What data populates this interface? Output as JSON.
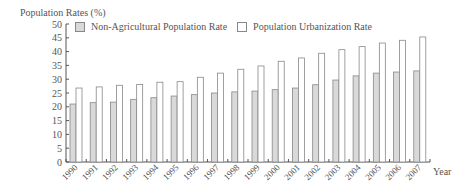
{
  "chart_data": {
    "type": "bar",
    "title": "",
    "ylabel": "Population Rates (%)",
    "xlabel": "Year",
    "ylim": [
      0,
      50
    ],
    "yticks": [
      0,
      5,
      10,
      15,
      20,
      25,
      30,
      35,
      40,
      45,
      50
    ],
    "grid": false,
    "legend_position": "top",
    "categories": [
      "1990",
      "1991",
      "1992",
      "1993",
      "1994",
      "1995",
      "1996",
      "1997",
      "1998",
      "1999",
      "2000",
      "2001",
      "2002",
      "2003",
      "2004",
      "2005",
      "2006",
      "2007"
    ],
    "series": [
      {
        "name": "Non-Agricultural Population Rate",
        "color": "#d9d9d9",
        "values": [
          21.0,
          21.5,
          21.7,
          22.7,
          23.3,
          23.9,
          24.4,
          25.0,
          25.4,
          25.7,
          26.2,
          26.8,
          28.0,
          29.7,
          31.2,
          32.2,
          32.6,
          33.0
        ]
      },
      {
        "name": "Population Urbanization Rate",
        "color": "#ffffff",
        "values": [
          26.8,
          27.2,
          27.8,
          28.1,
          28.9,
          29.1,
          30.7,
          32.2,
          33.6,
          34.8,
          36.5,
          37.7,
          39.4,
          40.7,
          41.8,
          43.1,
          44.1,
          45.3
        ]
      }
    ]
  },
  "labels": {
    "ytitle": "Population Rates (%)",
    "xtitle": "Year",
    "legend_series_1": "Non-Agricultural Population Rate",
    "legend_series_2": "Population Urbanization Rate"
  }
}
